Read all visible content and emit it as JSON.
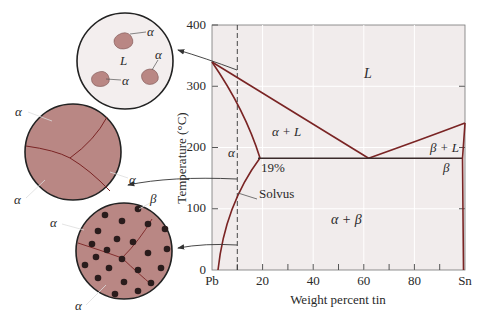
{
  "diagram": {
    "colors": {
      "plot_bg": "#f1ecec",
      "grid": "#ffffff",
      "phase_line": "#7a2424",
      "alpha_phase": "#b98784",
      "beta_dot": "#2a1c1c",
      "liquid_bg": "#f3eeee"
    },
    "axes": {
      "ylabel": "Temperature (°C)",
      "xlabel": "Weight percent tin",
      "y_ticks": [
        "0",
        "100",
        "200",
        "300",
        "400"
      ],
      "x_ticks": [
        "Pb",
        "20",
        "40",
        "60",
        "80",
        "Sn"
      ]
    },
    "regions": {
      "liquid": "L",
      "alpha_liquid": "α + L",
      "alpha": "α",
      "beta_liquid": "β + L",
      "beta": "β",
      "alpha_beta": "α + β"
    },
    "annotations": {
      "solubility": "19%",
      "solvus": "Solvus"
    },
    "microstructures": [
      {
        "name": "liquid-with-alpha",
        "labels": [
          "α",
          "α",
          "α",
          "L"
        ]
      },
      {
        "name": "alpha-grains",
        "labels": [
          "α",
          "α",
          "α"
        ]
      },
      {
        "name": "alpha-with-beta-precipitates",
        "labels": [
          "α",
          "β",
          "α"
        ]
      }
    ]
  }
}
